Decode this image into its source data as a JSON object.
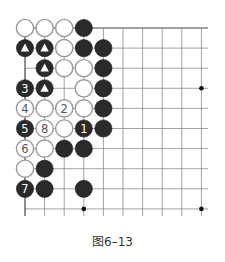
{
  "caption": "图6–13",
  "colors": {
    "line": "#8a8a8a",
    "edge": "#444444",
    "black_stone": "#2a2a2a",
    "white_stone_fill": "#ffffff",
    "white_stone_stroke": "#9a9a9a",
    "star_point": "#111111"
  },
  "grid": {
    "cols": 10,
    "rows": 10,
    "x0": 25,
    "y0": 28,
    "dx": 19.6,
    "dy": 20.1,
    "extend_right": 208,
    "extend_bottom": 216,
    "stone_radius": 8.6
  },
  "star_points": [
    {
      "col": 9,
      "row": 3
    },
    {
      "col": 9,
      "row": 9
    },
    {
      "col": 3,
      "row": 9
    }
  ],
  "stones": [
    {
      "col": 0,
      "row": 0,
      "color": "white",
      "label": ""
    },
    {
      "col": 1,
      "row": 0,
      "color": "white",
      "label": ""
    },
    {
      "col": 2,
      "row": 0,
      "color": "white",
      "label": ""
    },
    {
      "col": 3,
      "row": 0,
      "color": "black",
      "label": ""
    },
    {
      "col": 0,
      "row": 1,
      "color": "black",
      "label": "▲"
    },
    {
      "col": 1,
      "row": 1,
      "color": "black",
      "label": "▲"
    },
    {
      "col": 2,
      "row": 1,
      "color": "white",
      "label": ""
    },
    {
      "col": 3,
      "row": 1,
      "color": "black",
      "label": ""
    },
    {
      "col": 4,
      "row": 1,
      "color": "black",
      "label": ""
    },
    {
      "col": 1,
      "row": 2,
      "color": "black",
      "label": "▲"
    },
    {
      "col": 2,
      "row": 2,
      "color": "white",
      "label": ""
    },
    {
      "col": 3,
      "row": 2,
      "color": "white",
      "label": ""
    },
    {
      "col": 4,
      "row": 2,
      "color": "black",
      "label": ""
    },
    {
      "col": 0,
      "row": 3,
      "color": "black",
      "label": "3"
    },
    {
      "col": 1,
      "row": 3,
      "color": "black",
      "label": "▲"
    },
    {
      "col": 3,
      "row": 3,
      "color": "white",
      "label": ""
    },
    {
      "col": 4,
      "row": 3,
      "color": "black",
      "label": ""
    },
    {
      "col": 0,
      "row": 4,
      "color": "white",
      "label": "4"
    },
    {
      "col": 1,
      "row": 4,
      "color": "white",
      "label": ""
    },
    {
      "col": 2,
      "row": 4,
      "color": "white",
      "label": "2"
    },
    {
      "col": 3,
      "row": 4,
      "color": "white",
      "label": ""
    },
    {
      "col": 4,
      "row": 4,
      "color": "black",
      "label": ""
    },
    {
      "col": 0,
      "row": 5,
      "color": "black",
      "label": "5"
    },
    {
      "col": 1,
      "row": 5,
      "color": "white",
      "label": "8"
    },
    {
      "col": 2,
      "row": 5,
      "color": "white",
      "label": ""
    },
    {
      "col": 3,
      "row": 5,
      "color": "black",
      "label": "1"
    },
    {
      "col": 4,
      "row": 5,
      "color": "black",
      "label": ""
    },
    {
      "col": 0,
      "row": 6,
      "color": "white",
      "label": "6"
    },
    {
      "col": 1,
      "row": 6,
      "color": "white",
      "label": ""
    },
    {
      "col": 2,
      "row": 6,
      "color": "black",
      "label": ""
    },
    {
      "col": 3,
      "row": 6,
      "color": "black",
      "label": ""
    },
    {
      "col": 0,
      "row": 7,
      "color": "white",
      "label": ""
    },
    {
      "col": 1,
      "row": 7,
      "color": "black",
      "label": ""
    },
    {
      "col": 0,
      "row": 8,
      "color": "black",
      "label": "7"
    },
    {
      "col": 1,
      "row": 8,
      "color": "black",
      "label": ""
    },
    {
      "col": 3,
      "row": 8,
      "color": "black",
      "label": ""
    }
  ]
}
